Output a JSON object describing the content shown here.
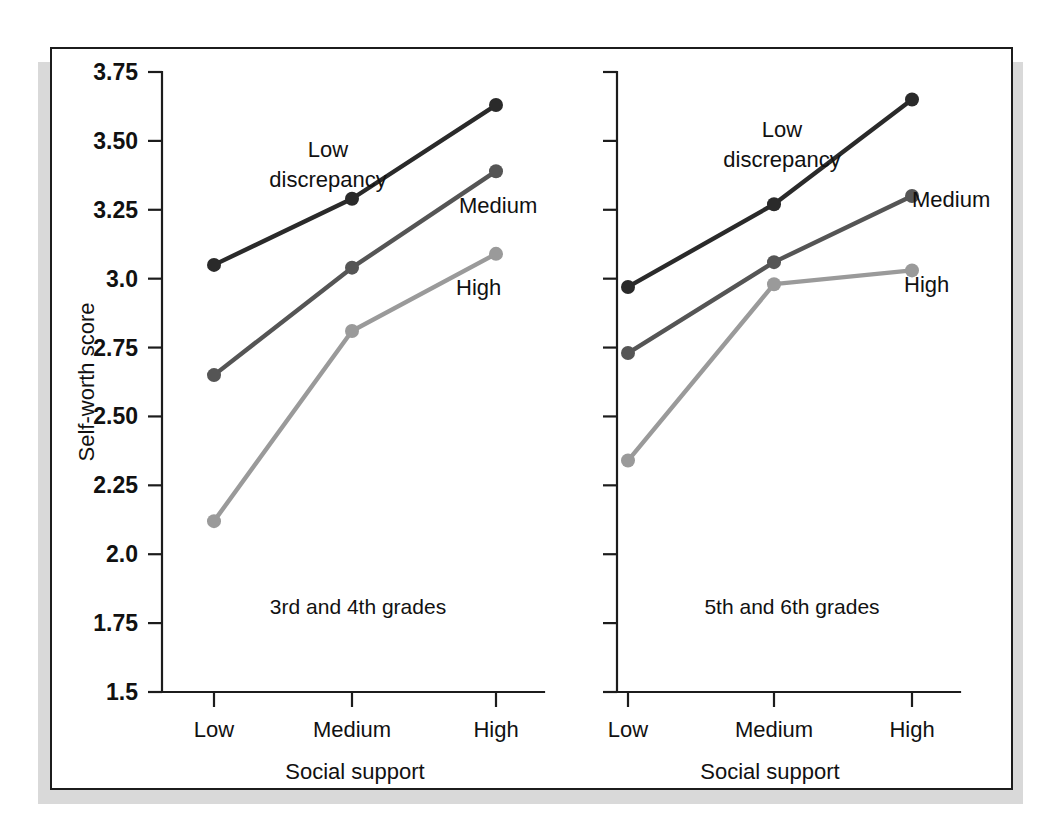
{
  "figure": {
    "background": "#ffffff",
    "frame_color": "#1c1c1c",
    "shadow_color": "#d9d9d9"
  },
  "axis": {
    "y_title": "Self-worth score",
    "x_title_left": "Social support",
    "x_title_right": "Social support",
    "y_ticks": [
      "3.75",
      "3.50",
      "3.25",
      "3.0",
      "2.75",
      "2.50",
      "2.25",
      "2.0",
      "1.75",
      "1.5"
    ],
    "x_ticks": [
      "Low",
      "Medium",
      "High"
    ]
  },
  "panels": {
    "left_caption": "3rd and 4th grades",
    "right_caption": "5th and 6th grades"
  },
  "series_labels": {
    "low_line1": "Low",
    "low_line2": "discrepancy",
    "medium": "Medium",
    "high": "High"
  },
  "colors": {
    "low_discrepancy": "#2a2a2a",
    "medium": "#555555",
    "high": "#9a9a9a"
  },
  "chart_data": {
    "type": "line",
    "title": "",
    "xlabel": "Social support",
    "ylabel": "Self-worth score",
    "categories": [
      "Low",
      "Medium",
      "High"
    ],
    "ylim": [
      1.5,
      3.75
    ],
    "ytick_values": [
      3.75,
      3.5,
      3.25,
      3.0,
      2.75,
      2.5,
      2.25,
      2.0,
      1.75,
      1.5
    ],
    "grid": false,
    "legend_position": "inline-annotations",
    "panels": [
      {
        "name": "3rd and 4th grades",
        "series": [
          {
            "name": "Low discrepancy",
            "color": "#2a2a2a",
            "values": [
              3.05,
              3.29,
              3.63
            ]
          },
          {
            "name": "Medium",
            "color": "#555555",
            "values": [
              2.65,
              3.04,
              3.39
            ]
          },
          {
            "name": "High",
            "color": "#9a9a9a",
            "values": [
              2.12,
              2.81,
              3.09
            ]
          }
        ]
      },
      {
        "name": "5th and 6th grades",
        "series": [
          {
            "name": "Low discrepancy",
            "color": "#2a2a2a",
            "values": [
              2.97,
              3.27,
              3.65
            ]
          },
          {
            "name": "Medium",
            "color": "#555555",
            "values": [
              2.73,
              3.06,
              3.3
            ]
          },
          {
            "name": "High",
            "color": "#9a9a9a",
            "values": [
              2.34,
              2.98,
              3.03
            ]
          }
        ]
      }
    ]
  }
}
